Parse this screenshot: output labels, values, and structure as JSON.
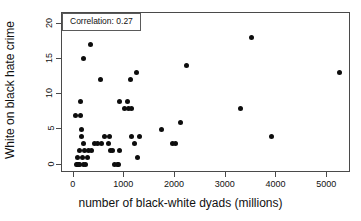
{
  "chart_data": {
    "type": "scatter",
    "title": "",
    "xlabel": "number of black-white dyads (millions)",
    "ylabel": "White on black hate crime",
    "xlim": [
      -230,
      5470
    ],
    "ylim": [
      -1.2,
      21.5
    ],
    "xticks": [
      0,
      1000,
      2000,
      3000,
      4000,
      5000
    ],
    "xtick_labels": [
      "0",
      "1000",
      "2000",
      "3000",
      "4000",
      "5000"
    ],
    "yticks": [
      0,
      5,
      10,
      15,
      20
    ],
    "ytick_labels": [
      "0",
      "5",
      "10",
      "15",
      "20"
    ],
    "grid": false,
    "legend_position": "top-left",
    "annotation": "Correlation: 0.27",
    "point_color": "#0d0d0d",
    "frame_color": "#4a4a4a",
    "series": [
      {
        "name": "states",
        "points": [
          [
            40,
            7
          ],
          [
            60,
            0
          ],
          [
            70,
            1
          ],
          [
            80,
            0
          ],
          [
            90,
            0
          ],
          [
            100,
            0
          ],
          [
            110,
            0
          ],
          [
            120,
            2
          ],
          [
            130,
            9
          ],
          [
            140,
            7
          ],
          [
            150,
            4
          ],
          [
            160,
            5
          ],
          [
            175,
            1
          ],
          [
            185,
            0
          ],
          [
            190,
            15
          ],
          [
            200,
            3
          ],
          [
            215,
            2
          ],
          [
            230,
            0
          ],
          [
            280,
            1
          ],
          [
            300,
            2
          ],
          [
            330,
            17
          ],
          [
            350,
            2
          ],
          [
            420,
            3
          ],
          [
            470,
            3
          ],
          [
            520,
            12
          ],
          [
            540,
            3
          ],
          [
            610,
            4
          ],
          [
            680,
            3
          ],
          [
            700,
            4
          ],
          [
            720,
            2
          ],
          [
            760,
            2
          ],
          [
            800,
            0
          ],
          [
            860,
            0
          ],
          [
            880,
            0
          ],
          [
            900,
            9
          ],
          [
            905,
            2
          ],
          [
            1010,
            8
          ],
          [
            1060,
            9
          ],
          [
            1090,
            8
          ],
          [
            1120,
            12
          ],
          [
            1140,
            8
          ],
          [
            1150,
            4
          ],
          [
            1200,
            3
          ],
          [
            1230,
            13
          ],
          [
            1260,
            1
          ],
          [
            1300,
            4
          ],
          [
            1740,
            5
          ],
          [
            1950,
            3
          ],
          [
            2000,
            3
          ],
          [
            2110,
            6
          ],
          [
            2230,
            14
          ],
          [
            3290,
            8
          ],
          [
            3510,
            18
          ],
          [
            3900,
            4
          ],
          [
            5250,
            13
          ]
        ]
      }
    ]
  }
}
